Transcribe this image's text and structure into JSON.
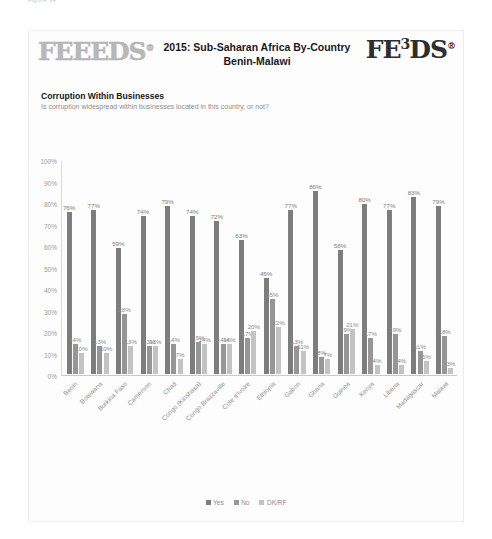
{
  "figure_caption": "Figure 34",
  "card": {
    "brand_left": "FEEEDS",
    "brand_left_reg": "®",
    "brand_right_pre": "FE",
    "brand_right_sup": "3",
    "brand_right_post": "DS",
    "brand_right_reg": "®",
    "title": "2015: Sub-Saharan Africa By-Country\nBenin-Malawi",
    "section_title": "Corruption Within Businesses",
    "section_subtitle": "Is corruption widespread within businesses located in this country, or not?"
  },
  "chart_data": {
    "type": "bar",
    "title": "Corruption Within Businesses",
    "subtitle": "Is corruption widespread within businesses located in this country, or not?",
    "xlabel": "",
    "ylabel": "",
    "ylim": [
      0,
      100
    ],
    "grid": false,
    "legend_position": "bottom",
    "y_ticks": [
      "100%",
      "90%",
      "80%",
      "70%",
      "60%",
      "50%",
      "40%",
      "30%",
      "20%",
      "10%",
      "0%"
    ],
    "categories": [
      "Benin",
      "Botswana",
      "Burkina Faso",
      "Cameroon",
      "Chad",
      "Congo (Kinshasa)",
      "Congo Brazzaville",
      "Cote d'Ivoire",
      "Ethiopia",
      "Gabon",
      "Ghana",
      "Guinea",
      "Kenya",
      "Liberia",
      "Madagascar",
      "Malawi"
    ],
    "series": [
      {
        "name": "Yes",
        "color": "#7d7d7d",
        "values": [
          76,
          77,
          59,
          74,
          79,
          74,
          72,
          63,
          45,
          77,
          86,
          58,
          80,
          77,
          83,
          79
        ],
        "labels": [
          "76%",
          "77%",
          "59%",
          "74%",
          "79%",
          "74%",
          "72%",
          "63%",
          "45%",
          "77%",
          "86%",
          "58%",
          "80%",
          "77%",
          "83%",
          "79%"
        ]
      },
      {
        "name": "No",
        "color": "#969696",
        "values": [
          14,
          13,
          28,
          13,
          14,
          15,
          14,
          17,
          35,
          13,
          8,
          19,
          17,
          19,
          11,
          18
        ],
        "labels": [
          "14%",
          "13%",
          "28%",
          "13%",
          "14%",
          "15%",
          "14%",
          "17%",
          "35%",
          "13%",
          "8%",
          "19%",
          "17%",
          "19%",
          "11%",
          "18%"
        ]
      },
      {
        "name": "DK/RF",
        "color": "#c3c3c3",
        "values": [
          10,
          10,
          13,
          13,
          7,
          14,
          14,
          20,
          22,
          11,
          7,
          21,
          4,
          4,
          6,
          3
        ],
        "labels": [
          "10%",
          "10%",
          "13%",
          "13%",
          "7%",
          "14%",
          "14%",
          "20%",
          "22%",
          "11%",
          "7%",
          "21%",
          "4%",
          "4%",
          "6%",
          "3%"
        ]
      }
    ]
  }
}
